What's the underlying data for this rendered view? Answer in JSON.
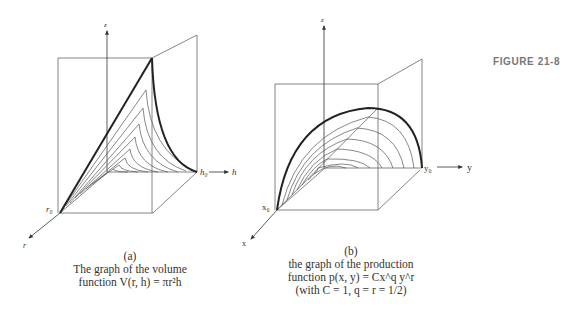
{
  "figure_label": "FIGURE 21-8",
  "panel_a": {
    "axes": {
      "z": "z",
      "h": "h",
      "r": "r",
      "h0": "h₀",
      "r0": "r₀"
    },
    "caption": {
      "tag": "(a)",
      "line1": "The graph of the volume",
      "line2": "function V(r, h) = πr²h"
    }
  },
  "panel_b": {
    "axes": {
      "z": "z",
      "y": "y",
      "x": "x",
      "y0": "y₀",
      "x0": "x₀"
    },
    "caption": {
      "tag": "(b)",
      "line1": "the graph of the production",
      "line2": "function p(x, y) = Cx^q y^r",
      "line3": "(with C = 1, q = r = 1/2)"
    }
  },
  "colors": {
    "line": "#555555",
    "thick": "#222222",
    "label": "#777777",
    "text": "#333333"
  }
}
